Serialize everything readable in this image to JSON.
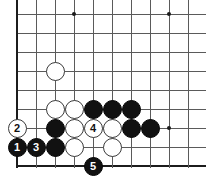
{
  "figure": {
    "type": "go-board-diagram",
    "board_background": "#ffffff",
    "line_color": "#5a5a5a",
    "edge_color": "#1c1c1c",
    "black_color": "#111111",
    "white_color": "#ffffff",
    "columns": 11,
    "rows": 9,
    "grid_spacing": 19,
    "origin_x": 17,
    "origin_y": 14
  },
  "star_points": [
    {
      "col": 3,
      "row": 0
    },
    {
      "col": 8,
      "row": 0
    },
    {
      "col": 8,
      "row": 6
    }
  ],
  "stones": [
    {
      "id": "w-a",
      "color": "white",
      "col": 2,
      "row": 3,
      "label": ""
    },
    {
      "id": "w-b",
      "color": "white",
      "col": 2,
      "row": 5,
      "label": ""
    },
    {
      "id": "w-c",
      "color": "white",
      "col": 3,
      "row": 5,
      "label": ""
    },
    {
      "id": "b-a",
      "color": "black",
      "col": 4,
      "row": 5,
      "label": ""
    },
    {
      "id": "b-b",
      "color": "black",
      "col": 5,
      "row": 5,
      "label": ""
    },
    {
      "id": "b-c",
      "color": "black",
      "col": 6,
      "row": 5,
      "label": ""
    },
    {
      "id": "move-2",
      "color": "white",
      "col": 0,
      "row": 6,
      "label": "2"
    },
    {
      "id": "b-d",
      "color": "black",
      "col": 2,
      "row": 6,
      "label": ""
    },
    {
      "id": "w-d",
      "color": "white",
      "col": 3,
      "row": 6,
      "label": ""
    },
    {
      "id": "move-4",
      "color": "white",
      "col": 4,
      "row": 6,
      "label": "4"
    },
    {
      "id": "w-e",
      "color": "white",
      "col": 5,
      "row": 6,
      "label": ""
    },
    {
      "id": "b-e",
      "color": "black",
      "col": 6,
      "row": 6,
      "label": ""
    },
    {
      "id": "b-f",
      "color": "black",
      "col": 7,
      "row": 6,
      "label": ""
    },
    {
      "id": "move-1",
      "color": "black",
      "col": 0,
      "row": 7,
      "label": "1"
    },
    {
      "id": "move-3",
      "color": "black",
      "col": 1,
      "row": 7,
      "label": "3"
    },
    {
      "id": "b-g",
      "color": "black",
      "col": 2,
      "row": 7,
      "label": ""
    },
    {
      "id": "w-f",
      "color": "white",
      "col": 3,
      "row": 7,
      "label": ""
    },
    {
      "id": "w-g",
      "color": "white",
      "col": 5,
      "row": 7,
      "label": ""
    },
    {
      "id": "move-5",
      "color": "black",
      "col": 4,
      "row": 8,
      "label": "5"
    }
  ]
}
